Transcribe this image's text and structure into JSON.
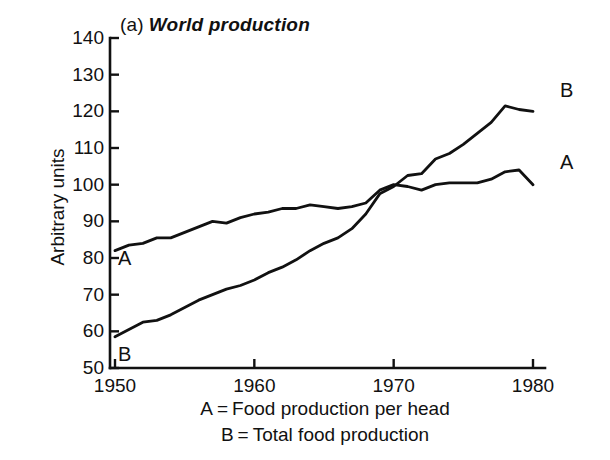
{
  "figure": {
    "panel_tag": "(a)",
    "title": "World production",
    "background": "#ffffff",
    "ink_color": "#111111"
  },
  "legend": {
    "position": "below-axis",
    "rows": [
      {
        "key": "A",
        "eq": "=",
        "text": "Food production per head"
      },
      {
        "key": "B",
        "eq": "=",
        "text": "Total food production"
      }
    ]
  },
  "annotations": {
    "a_start": "A",
    "b_start": "B",
    "a_end": "A",
    "b_end": "B"
  },
  "chart_data": {
    "type": "line",
    "xlabel": "",
    "ylabel": "Arbitrary units",
    "xlim": [
      1950,
      1980
    ],
    "ylim": [
      50,
      140
    ],
    "grid": false,
    "legend_position": "below-axis",
    "xticks": [
      1950,
      1960,
      1970,
      1980
    ],
    "xtick_labels": [
      "1950",
      "1960",
      "1970",
      "1980"
    ],
    "yticks": [
      50,
      60,
      70,
      80,
      90,
      100,
      110,
      120,
      130,
      140
    ],
    "ytick_labels": [
      "50",
      "60",
      "70",
      "80",
      "90",
      "100",
      "110",
      "120",
      "130",
      "140"
    ],
    "x": [
      1950,
      1951,
      1952,
      1953,
      1954,
      1955,
      1956,
      1957,
      1958,
      1959,
      1960,
      1961,
      1962,
      1963,
      1964,
      1965,
      1966,
      1967,
      1968,
      1969,
      1970,
      1971,
      1972,
      1973,
      1974,
      1975,
      1976,
      1977,
      1978,
      1979,
      1980
    ],
    "series": [
      {
        "name": "A",
        "label": "Food production per head",
        "values": [
          82.0,
          83.5,
          84.0,
          85.5,
          85.5,
          87.0,
          88.5,
          90.0,
          89.5,
          91.0,
          92.0,
          92.5,
          93.5,
          93.5,
          94.5,
          94.0,
          93.5,
          94.0,
          95.0,
          98.5,
          100.0,
          99.5,
          98.5,
          100.0,
          100.5,
          100.5,
          100.5,
          101.5,
          103.5,
          104.0,
          100.0
        ]
      },
      {
        "name": "B",
        "label": "Total food production",
        "values": [
          58.5,
          60.5,
          62.5,
          63.0,
          64.5,
          66.5,
          68.5,
          70.0,
          71.5,
          72.5,
          74.0,
          76.0,
          77.5,
          79.5,
          82.0,
          84.0,
          85.5,
          88.0,
          92.0,
          97.5,
          99.5,
          102.5,
          103.0,
          107.0,
          108.5,
          111.0,
          114.0,
          117.0,
          121.5,
          120.5,
          120.0
        ]
      }
    ]
  }
}
